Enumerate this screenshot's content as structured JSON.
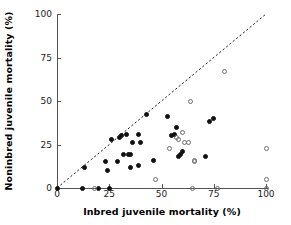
{
  "chart_data": {
    "type": "scatter",
    "title": "",
    "xlabel": "Inbred juvenile mortality (%)",
    "ylabel": "Noninbred juvenile mortality (%)",
    "xlim": [
      0,
      100
    ],
    "ylim": [
      0,
      100
    ],
    "xticks": [
      0,
      25,
      50,
      75,
      100
    ],
    "yticks": [
      0,
      25,
      50,
      75,
      100
    ],
    "xticklabels": [
      "0",
      "25",
      "50",
      "75",
      "100"
    ],
    "yticklabels": [
      "0",
      "25",
      "50",
      "75",
      "100"
    ],
    "grid": false,
    "legend": null,
    "annotations": [
      {
        "type": "reference-line",
        "style": "dashed",
        "description": "1:1 diagonal line of equality",
        "from": [
          0,
          0
        ],
        "to": [
          100,
          100
        ]
      }
    ],
    "series": [
      {
        "name": "Filled circles",
        "marker": "filled-circle",
        "color": "#111111",
        "points": [
          [
            0,
            0
          ],
          [
            12,
            0
          ],
          [
            20,
            0
          ],
          [
            25,
            0
          ],
          [
            13,
            12
          ],
          [
            23,
            15
          ],
          [
            24,
            10
          ],
          [
            26,
            28
          ],
          [
            29,
            15
          ],
          [
            30,
            29
          ],
          [
            31,
            30
          ],
          [
            32,
            19
          ],
          [
            33,
            31
          ],
          [
            34,
            19
          ],
          [
            35,
            19
          ],
          [
            35,
            12
          ],
          [
            36,
            26
          ],
          [
            39,
            31
          ],
          [
            39,
            13
          ],
          [
            40,
            26
          ],
          [
            43,
            42
          ],
          [
            46,
            16
          ],
          [
            53,
            41
          ],
          [
            55,
            30
          ],
          [
            56,
            31
          ],
          [
            57,
            35
          ],
          [
            58,
            18
          ],
          [
            59,
            19
          ],
          [
            60,
            21
          ],
          [
            71,
            18
          ],
          [
            73,
            38
          ],
          [
            75,
            40
          ]
        ]
      },
      {
        "name": "Open circles",
        "marker": "open-circle",
        "color": "#6e6e6e",
        "points": [
          [
            18,
            0
          ],
          [
            65,
            0
          ],
          [
            77,
            0
          ],
          [
            100,
            0
          ],
          [
            47,
            5
          ],
          [
            54,
            23
          ],
          [
            57,
            29
          ],
          [
            58,
            28
          ],
          [
            60,
            32
          ],
          [
            61,
            26
          ],
          [
            63,
            26
          ],
          [
            64,
            50
          ],
          [
            66,
            15
          ],
          [
            66,
            16
          ],
          [
            80,
            67
          ],
          [
            100,
            23
          ],
          [
            100,
            5
          ]
        ]
      }
    ]
  }
}
